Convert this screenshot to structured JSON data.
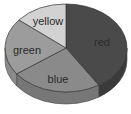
{
  "chart_data": {
    "type": "pie",
    "style": "3d",
    "title": "",
    "categories": [
      "red",
      "blue",
      "green",
      "yellow"
    ],
    "values": [
      41,
      24,
      21,
      14
    ],
    "unit": "percent (estimated from slice angles)",
    "start_angle_deg": 0,
    "direction": "clockwise",
    "colors": {
      "red": "#4a4a4a",
      "blue": "#8a8a8a",
      "green": "#9c9c9c",
      "yellow": "#d2d2d2"
    },
    "side_colors": {
      "red": "#3a3a3a",
      "blue": "#777777",
      "green": "#8a8a8a",
      "yellow": "#bcbcbc"
    },
    "labels_inside": true,
    "legend": "none"
  }
}
